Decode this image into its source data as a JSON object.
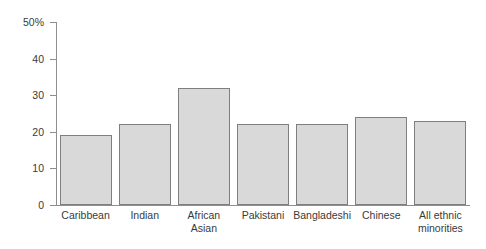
{
  "chart_data": {
    "type": "bar",
    "title": "",
    "subtitle": "",
    "xlabel": "",
    "ylabel": "",
    "ylim": [
      0,
      50
    ],
    "grid": false,
    "legend": "none",
    "yunit": "%",
    "ytick_labels": [
      "50%",
      "40",
      "30",
      "20",
      "10",
      "0"
    ],
    "ytick_values": [
      50,
      40,
      30,
      20,
      10,
      0
    ],
    "categories": [
      "Caribbean",
      "Indian",
      "African\nAsian",
      "Pakistani",
      "Bangladeshi",
      "Chinese",
      "All ethnic\nminorities"
    ],
    "category_lines": [
      [
        "Caribbean"
      ],
      [
        "Indian"
      ],
      [
        "African",
        "Asian"
      ],
      [
        "Pakistani"
      ],
      [
        "Bangladeshi"
      ],
      [
        "Chinese"
      ],
      [
        "All ethnic",
        "minorities"
      ]
    ],
    "values": [
      19,
      22,
      32,
      22,
      22,
      24,
      23
    ],
    "series": [
      {
        "name": "",
        "values": [
          19,
          22,
          32,
          22,
          22,
          24,
          23
        ]
      }
    ]
  },
  "style": {
    "bar_fill": "#d9d9d9",
    "bar_stroke": "#7f7f7f",
    "axis_color": "#8e8e8e",
    "text_color": "#3a3a3a",
    "background": "#ffffff"
  }
}
